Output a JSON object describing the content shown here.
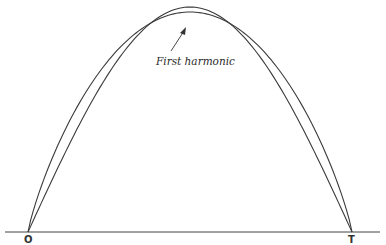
{
  "figure": {
    "annotation": "First harmonic",
    "origin_label": "O",
    "end_label": "T",
    "curves": [
      {
        "name": "first harmonic (sine half-wave)",
        "peak_y_px": 7
      },
      {
        "name": "original waveform (parabolic arch)",
        "peak_y_px": 12
      }
    ],
    "colors": {
      "line": "#3a3a3a",
      "background": "#ffffff"
    }
  }
}
